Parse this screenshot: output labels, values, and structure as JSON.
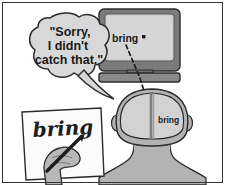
{
  "panel": {
    "name": "speech-recognition-error-cartoon",
    "border_color": "#333333",
    "background": "#ffffff"
  },
  "speech_bubble": {
    "lines": [
      "\"Sorry,",
      "I didn't",
      "catch that.\""
    ],
    "line1": "\"Sorry,",
    "line2": "I didn't",
    "line3": "catch that.\"",
    "fill": "#d8d8d8",
    "stroke": "#2b2b2b"
  },
  "monitor": {
    "screen_text": "bring",
    "cursor": "·",
    "bezel_color": "#7b7b7b",
    "screen_color": "#cfcfcf",
    "stand_color": "#8a8a8a"
  },
  "head": {
    "brain_text": "bring",
    "skin_color": "#b3b3b3",
    "brain_color": "#d2d2d2",
    "outline_color": "#2b2b2b"
  },
  "paper": {
    "handwritten_word": "bring",
    "fill": "#fbfbfb",
    "stroke": "#2b2b2b"
  },
  "hand": {
    "skin_color": "#b8b8b8",
    "pen_color": "#1c1c1c"
  },
  "annotations": {
    "dashed_line_label": "speech-to-brain-dashed-link",
    "dash_color": "#1e1e1e"
  }
}
